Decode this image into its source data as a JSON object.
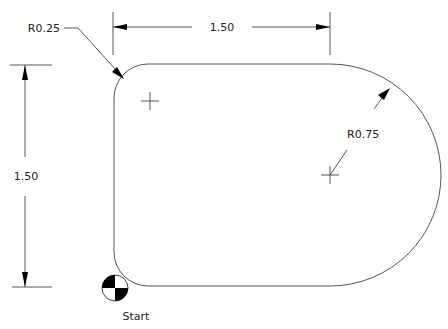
{
  "diagram": {
    "type": "cad-part-drawing",
    "colors": {
      "background": "#ffffff",
      "geometry": "#555555",
      "dimension": "#444444",
      "text": "#222222"
    },
    "dimensions": {
      "width": {
        "label": "1.50",
        "orientation": "horizontal"
      },
      "height": {
        "label": "1.50",
        "orientation": "vertical"
      },
      "corner_radius": {
        "label": "R0.25"
      },
      "arc_radius": {
        "label": "R0.75"
      }
    },
    "start_marker": {
      "label": "Start",
      "icon": "datum-target-icon"
    },
    "center_marks": [
      {
        "name": "corner-center-mark"
      },
      {
        "name": "arc-center-mark"
      }
    ]
  }
}
